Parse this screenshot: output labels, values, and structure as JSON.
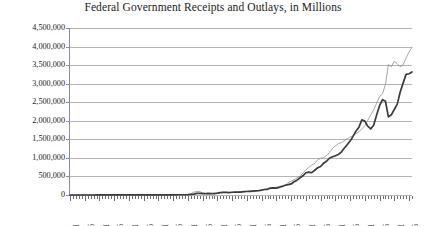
{
  "chart_data": {
    "type": "line",
    "title": "Federal Government Receipts and Outlays, in Millions",
    "xlabel": "",
    "ylabel": "",
    "xlim": [
      1901,
      2017
    ],
    "ylim": [
      0,
      4500000
    ],
    "grid": true,
    "legend_position": "none",
    "ytick_labels": [
      "4,500,000",
      "4,000,000",
      "3,500,000",
      "3,000,000",
      "2,500,000",
      "2,000,000",
      "1,500,000",
      "1,000,000",
      "500,000",
      "0"
    ],
    "ytick_values": [
      4500000,
      4000000,
      3500000,
      3000000,
      2500000,
      2000000,
      1500000,
      1000000,
      500000,
      0
    ],
    "xtick_labels": [
      "1901",
      "1906",
      "1911",
      "1916",
      "1921",
      "1926",
      "1931",
      "1936",
      "1941",
      "1946",
      "1951",
      "1956",
      "1961",
      "1966",
      "1971",
      "1976",
      "1981",
      "1986",
      "1991",
      "1996",
      "2001",
      "2006",
      "2011",
      "2016"
    ],
    "xtick_values": [
      1901,
      1906,
      1911,
      1916,
      1921,
      1926,
      1931,
      1936,
      1941,
      1946,
      1951,
      1956,
      1961,
      1966,
      1971,
      1976,
      1981,
      1986,
      1991,
      1996,
      2001,
      2006,
      2011,
      2016
    ],
    "x": [
      1901,
      1902,
      1903,
      1904,
      1905,
      1906,
      1907,
      1908,
      1909,
      1910,
      1911,
      1912,
      1913,
      1914,
      1915,
      1916,
      1917,
      1918,
      1919,
      1920,
      1921,
      1922,
      1923,
      1924,
      1925,
      1926,
      1927,
      1928,
      1929,
      1930,
      1931,
      1932,
      1933,
      1934,
      1935,
      1936,
      1937,
      1938,
      1939,
      1940,
      1941,
      1942,
      1943,
      1944,
      1945,
      1946,
      1947,
      1948,
      1949,
      1950,
      1951,
      1952,
      1953,
      1954,
      1955,
      1956,
      1957,
      1958,
      1959,
      1960,
      1961,
      1962,
      1963,
      1964,
      1965,
      1966,
      1967,
      1968,
      1969,
      1970,
      1971,
      1972,
      1973,
      1974,
      1975,
      1976,
      1977,
      1978,
      1979,
      1980,
      1981,
      1982,
      1983,
      1984,
      1985,
      1986,
      1987,
      1988,
      1989,
      1990,
      1991,
      1992,
      1993,
      1994,
      1995,
      1996,
      1997,
      1998,
      1999,
      2000,
      2001,
      2002,
      2003,
      2004,
      2005,
      2006,
      2007,
      2008,
      2009,
      2010,
      2011,
      2012,
      2013,
      2014,
      2015,
      2016,
      2017
    ],
    "series": [
      {
        "name": "Outlays",
        "style": "thin-light-line",
        "color": "#8f8f8f",
        "values": [
          525,
          485,
          517,
          584,
          567,
          570,
          579,
          659,
          694,
          694,
          691,
          690,
          715,
          726,
          746,
          713,
          1954,
          12677,
          18493,
          6358,
          5062,
          3289,
          3140,
          2908,
          2924,
          2930,
          2857,
          2961,
          3127,
          3320,
          3577,
          4659,
          4598,
          6541,
          6412,
          8228,
          7580,
          6840,
          9141,
          9468,
          13653,
          35137,
          78555,
          91304,
          92712,
          55232,
          34496,
          29764,
          38835,
          42562,
          45514,
          67686,
          76101,
          70855,
          68444,
          70640,
          76578,
          82405,
          92098,
          92191,
          97723,
          106821,
          111316,
          118528,
          118228,
          134532,
          157464,
          178134,
          183640,
          195649,
          210172,
          230681,
          245707,
          269359,
          332332,
          371792,
          409218,
          458746,
          504028,
          590941,
          678241,
          745743,
          808364,
          851805,
          946344,
          990382,
          1004017,
          1064416,
          1143744,
          1252993,
          1324226,
          1381529,
          1409386,
          1461752,
          1515742,
          1560484,
          1601116,
          1652452,
          1701842,
          1788950,
          1862846,
          2010894,
          2159899,
          2292841,
          2471957,
          2655050,
          2728686,
          2982544,
          3517677,
          3457079,
          3603059,
          3536945,
          3454647,
          3506284,
          3691850,
          3852612,
          3981634
        ]
      },
      {
        "name": "Receipts",
        "style": "thick-dark-line",
        "color": "#3b3b3b",
        "values": [
          588,
          562,
          562,
          541,
          544,
          595,
          666,
          602,
          604,
          676,
          702,
          693,
          714,
          725,
          683,
          761,
          1101,
          3645,
          5130,
          6649,
          5571,
          4026,
          3853,
          3871,
          3641,
          3795,
          4013,
          3900,
          3862,
          4058,
          3116,
          1924,
          1997,
          2955,
          3609,
          3923,
          5387,
          6751,
          6295,
          6548,
          8712,
          14634,
          24001,
          43747,
          45159,
          39296,
          38514,
          41560,
          39415,
          39443,
          51616,
          66167,
          69608,
          69701,
          65451,
          74587,
          79990,
          79636,
          79249,
          92492,
          94388,
          99676,
          106560,
          112613,
          116817,
          130835,
          148822,
          152973,
          186882,
          192807,
          187139,
          207309,
          230799,
          263224,
          279090,
          298060,
          355559,
          399561,
          463302,
          517112,
          599272,
          617766,
          600562,
          666438,
          734037,
          769155,
          854288,
          909238,
          991105,
          1031958,
          1054988,
          1091208,
          1154335,
          1258566,
          1351790,
          1453053,
          1579232,
          1721728,
          1827452,
          2025191,
          1991082,
          1853136,
          1782314,
          1880114,
          2153611,
          2406869,
          2567985,
          2523991,
          2104989,
          2162706,
          2303466,
          2449988,
          2775103,
          3021487,
          3249886,
          3267961,
          3316182
        ]
      }
    ]
  }
}
